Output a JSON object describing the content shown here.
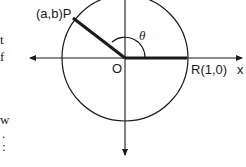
{
  "diagram": {
    "type": "unit-circle-angle",
    "labels": {
      "point_p": "(a,b)P",
      "point_r": "R(1,0)",
      "origin": "O",
      "x_axis": "x",
      "angle": "θ"
    },
    "margin_text_fragments": [
      "t",
      "f",
      "w",
      ".",
      ":"
    ],
    "colors": {
      "stroke": "#1a1a1a",
      "background": "#ffffff"
    }
  }
}
